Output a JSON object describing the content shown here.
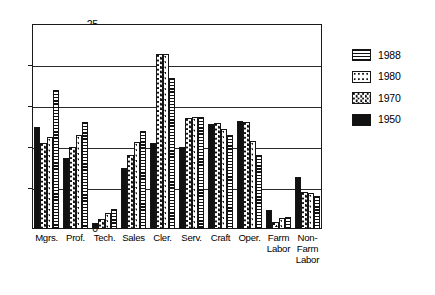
{
  "chart_data": {
    "type": "bar",
    "title": "",
    "xlabel": "",
    "ylabel": "",
    "ylim": [
      0,
      25
    ],
    "yticks": [
      0,
      5,
      10,
      15,
      20,
      25
    ],
    "grid": true,
    "legend_position": "right",
    "categories": [
      "Mgrs.",
      "Prof.",
      "Tech.",
      "Sales",
      "Cler.",
      "Serv.",
      "Craft",
      "Oper.",
      "Farm\nLabor",
      "Non-\nFarm\nLabor"
    ],
    "series": [
      {
        "name": "1950",
        "pattern": "solid-black",
        "values": [
          12.4,
          8.6,
          0.7,
          7.5,
          10.5,
          10.0,
          12.8,
          13.2,
          2.3,
          6.3
        ]
      },
      {
        "name": "1970",
        "pattern": "dense-speckle",
        "values": [
          10.5,
          10.0,
          1.2,
          9.0,
          21.3,
          13.5,
          12.9,
          13.1,
          0.8,
          4.5
        ]
      },
      {
        "name": "1980",
        "pattern": "sparse-dots",
        "values": [
          11.2,
          11.5,
          2.0,
          10.6,
          21.3,
          13.7,
          12.2,
          10.7,
          1.3,
          4.4
        ]
      },
      {
        "name": "1988",
        "pattern": "horizontal-lines",
        "values": [
          17.0,
          13.0,
          2.5,
          12.0,
          18.4,
          13.6,
          11.5,
          9.0,
          1.5,
          4.0
        ]
      }
    ]
  },
  "legend": {
    "items": [
      {
        "label": "1988"
      },
      {
        "label": "1980"
      },
      {
        "label": "1970"
      },
      {
        "label": "1950"
      }
    ]
  }
}
